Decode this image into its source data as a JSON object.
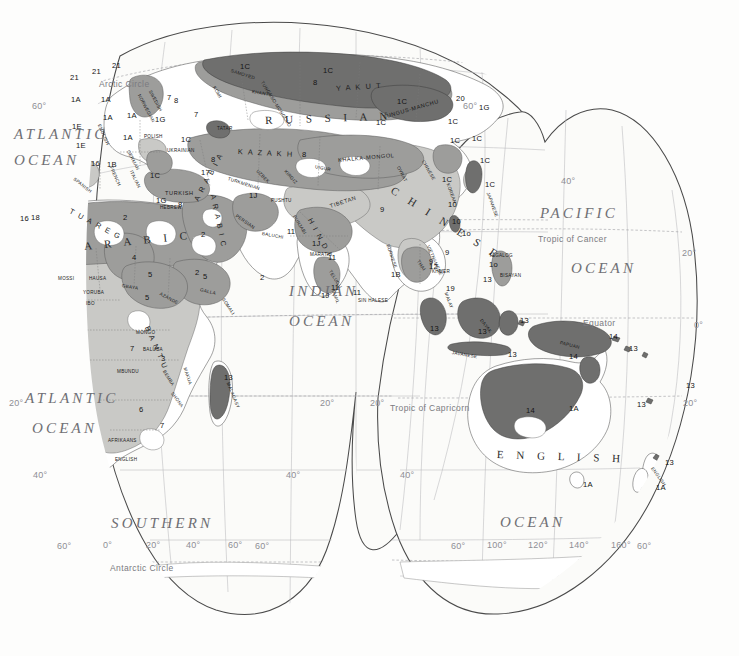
{
  "map": {
    "title": "World Language Families Map (Eastern Hemisphere)",
    "projection": "interrupted-homolosine",
    "palette": {
      "background": "#fdfdfc",
      "ocean": "#fbfbf9",
      "land_light": "#ffffff",
      "shade_light": "#c9c9c6",
      "shade_medium": "#9d9d9b",
      "shade_dark": "#6f6f6e",
      "shade_darkest": "#4b4b4a",
      "outline": "#4a4a4a",
      "border": "#6b6b6b",
      "graticule": "#9b9b9f",
      "label_ocean": "#6f6f74"
    },
    "oceans": [
      {
        "name": "ATLANTIC",
        "x": 14,
        "y": 126,
        "size": "major"
      },
      {
        "name": "OCEAN",
        "x": 14,
        "y": 152,
        "size": "major"
      },
      {
        "name": "ATLANTIC",
        "x": 25,
        "y": 390,
        "size": "major"
      },
      {
        "name": "OCEAN",
        "x": 32,
        "y": 420,
        "size": "major"
      },
      {
        "name": "INDIAN",
        "x": 289,
        "y": 283,
        "size": "major"
      },
      {
        "name": "OCEAN",
        "x": 289,
        "y": 313,
        "size": "major"
      },
      {
        "name": "PACIFIC",
        "x": 540,
        "y": 205,
        "size": "major"
      },
      {
        "name": "OCEAN",
        "x": 571,
        "y": 260,
        "size": "major"
      },
      {
        "name": "SOUTHERN",
        "x": 111,
        "y": 515,
        "size": "major"
      },
      {
        "name": "OCEAN",
        "x": 500,
        "y": 514,
        "size": "major"
      }
    ],
    "reference_lines": [
      {
        "label": "Arctic Circle",
        "x": 99,
        "y": 79
      },
      {
        "label": "Tropic of Cancer",
        "x": 538,
        "y": 234
      },
      {
        "label": "Equator",
        "x": 583,
        "y": 318
      },
      {
        "label": "Tropic of Capricorn",
        "x": 390,
        "y": 403
      },
      {
        "label": "Antarctic Circle",
        "x": 110,
        "y": 563
      }
    ],
    "graticule_labels": [
      {
        "label": "60°",
        "x": 32,
        "y": 101
      },
      {
        "label": "60°",
        "x": 463,
        "y": 101
      },
      {
        "label": "40°",
        "x": 561,
        "y": 176
      },
      {
        "label": "20°",
        "x": 682,
        "y": 248
      },
      {
        "label": "0°",
        "x": 694,
        "y": 320
      },
      {
        "label": "20°",
        "x": 9,
        "y": 398
      },
      {
        "label": "20°",
        "x": 320,
        "y": 398
      },
      {
        "label": "20°",
        "x": 370,
        "y": 398
      },
      {
        "label": "20°",
        "x": 683,
        "y": 398
      },
      {
        "label": "40°",
        "x": 33,
        "y": 470
      },
      {
        "label": "40°",
        "x": 286,
        "y": 470
      },
      {
        "label": "40°",
        "x": 400,
        "y": 470
      },
      {
        "label": "60°",
        "x": 57,
        "y": 541
      },
      {
        "label": "0°",
        "x": 103,
        "y": 540
      },
      {
        "label": "20°",
        "x": 146,
        "y": 540
      },
      {
        "label": "40°",
        "x": 186,
        "y": 540
      },
      {
        "label": "60°",
        "x": 228,
        "y": 540
      },
      {
        "label": "60°",
        "x": 255,
        "y": 541
      },
      {
        "label": "60°",
        "x": 451,
        "y": 541
      },
      {
        "label": "100°",
        "x": 487,
        "y": 540
      },
      {
        "label": "120°",
        "x": 528,
        "y": 540
      },
      {
        "label": "140°",
        "x": 569,
        "y": 540
      },
      {
        "label": "160°",
        "x": 611,
        "y": 540
      },
      {
        "label": "60°",
        "x": 637,
        "y": 541
      }
    ],
    "language_labels": [
      {
        "text": "R U S S I A N",
        "x": 265,
        "y": 114,
        "cls": "lang-big",
        "rot": -2
      },
      {
        "text": "C H I N E S E",
        "x": 392,
        "y": 183,
        "cls": "lang-big",
        "rot": 32
      },
      {
        "text": "A R A B I C",
        "x": 84,
        "y": 240,
        "cls": "lang-big",
        "rot": -6
      },
      {
        "text": "E N G L I S H",
        "x": 497,
        "y": 448,
        "cls": "lang-big",
        "rot": 2
      },
      {
        "text": "K A Z A K H",
        "x": 238,
        "y": 147,
        "cls": "lang-mid",
        "rot": 3
      },
      {
        "text": "Y A K U T",
        "x": 336,
        "y": 84,
        "cls": "lang-mid",
        "rot": -4
      },
      {
        "text": "A R A B I C",
        "x": 213,
        "y": 190,
        "cls": "lang-mid",
        "rot": 78
      },
      {
        "text": "T U A R E G",
        "x": 70,
        "y": 206,
        "cls": "lang-mid",
        "rot": 28
      },
      {
        "text": "B A N T U",
        "x": 147,
        "y": 322,
        "cls": "lang-mid",
        "rot": 66
      },
      {
        "text": "A R A B I A",
        "x": 196,
        "y": 196,
        "cls": "lang-mid",
        "rot": -62
      },
      {
        "text": "H I N D I",
        "x": 310,
        "y": 214,
        "cls": "lang-mid",
        "rot": 62
      },
      {
        "text": "TIBETAN",
        "x": 330,
        "y": 203,
        "cls": "lang-small",
        "rot": -18
      },
      {
        "text": "TUNGUS-MANCHU",
        "x": 383,
        "y": 114,
        "cls": "lang-small",
        "rot": -16
      },
      {
        "text": "TUNGUSO-MONGOLO",
        "x": 262,
        "y": 79,
        "cls": "lang-tiny",
        "rot": 58
      },
      {
        "text": "KHALKA-MONGOL",
        "x": 338,
        "y": 157,
        "cls": "lang-small",
        "rot": -5
      },
      {
        "text": "SAMOYED",
        "x": 231,
        "y": 68,
        "cls": "lang-tiny",
        "rot": 18
      },
      {
        "text": "KHANTY",
        "x": 252,
        "y": 89,
        "cls": "lang-tiny",
        "rot": 10
      },
      {
        "text": "KOMI",
        "x": 214,
        "y": 84,
        "cls": "lang-tiny",
        "rot": 60
      },
      {
        "text": "TATAR",
        "x": 217,
        "y": 126,
        "cls": "lang-tiny",
        "rot": 0
      },
      {
        "text": "UZBEK",
        "x": 257,
        "y": 168,
        "cls": "lang-tiny",
        "rot": 45
      },
      {
        "text": "KIRGIZ",
        "x": 285,
        "y": 168,
        "cls": "lang-tiny",
        "rot": 48
      },
      {
        "text": "UIGUR",
        "x": 315,
        "y": 164,
        "cls": "lang-tiny",
        "rot": 12
      },
      {
        "text": "TURKMENIAN",
        "x": 228,
        "y": 176,
        "cls": "lang-tiny",
        "rot": 18
      },
      {
        "text": "OYRAT",
        "x": 398,
        "y": 164,
        "cls": "lang-tiny",
        "rot": 62
      },
      {
        "text": "CHINESE",
        "x": 423,
        "y": 158,
        "cls": "lang-tiny",
        "rot": 60
      },
      {
        "text": "KOREAN",
        "x": 448,
        "y": 181,
        "cls": "lang-tiny",
        "rot": 70
      },
      {
        "text": "JAPANESE",
        "x": 488,
        "y": 190,
        "cls": "lang-tiny",
        "rot": 70
      },
      {
        "text": "TURKISH",
        "x": 165,
        "y": 190,
        "cls": "lang-small",
        "rot": 0
      },
      {
        "text": "HEBREW",
        "x": 160,
        "y": 205,
        "cls": "lang-tiny",
        "rot": 0
      },
      {
        "text": "PERSIAN",
        "x": 236,
        "y": 213,
        "cls": "lang-tiny",
        "rot": 34
      },
      {
        "text": "PUSHTU",
        "x": 271,
        "y": 198,
        "cls": "lang-tiny",
        "rot": 0
      },
      {
        "text": "PUNJABI",
        "x": 294,
        "y": 213,
        "cls": "lang-tiny",
        "rot": 58
      },
      {
        "text": "BALUCHI",
        "x": 262,
        "y": 231,
        "cls": "lang-tiny",
        "rot": 10
      },
      {
        "text": "MARATHI",
        "x": 310,
        "y": 252,
        "cls": "lang-tiny",
        "rot": 0
      },
      {
        "text": "TELUGU",
        "x": 330,
        "y": 268,
        "cls": "lang-tiny",
        "rot": 58
      },
      {
        "text": "TAMIL",
        "x": 333,
        "y": 287,
        "cls": "lang-tiny",
        "rot": 70
      },
      {
        "text": "SIN HALESE",
        "x": 358,
        "y": 298,
        "cls": "lang-tiny",
        "rot": 0
      },
      {
        "text": "BURMESE",
        "x": 388,
        "y": 242,
        "cls": "lang-tiny",
        "rot": 72
      },
      {
        "text": "THAI",
        "x": 418,
        "y": 258,
        "cls": "lang-tiny",
        "rot": 56
      },
      {
        "text": "KHMER",
        "x": 432,
        "y": 269,
        "cls": "lang-tiny",
        "rot": 0
      },
      {
        "text": "VIETNAMESE",
        "x": 428,
        "y": 243,
        "cls": "lang-tiny",
        "rot": 66
      },
      {
        "text": "MALAY",
        "x": 446,
        "y": 290,
        "cls": "lang-tiny",
        "rot": 70
      },
      {
        "text": "TAGALOG",
        "x": 489,
        "y": 253,
        "cls": "lang-tiny",
        "rot": 0
      },
      {
        "text": "BISAYAN",
        "x": 500,
        "y": 273,
        "cls": "lang-tiny",
        "rot": 0
      },
      {
        "text": "DAYAK",
        "x": 481,
        "y": 317,
        "cls": "lang-tiny",
        "rot": 52
      },
      {
        "text": "JAVANESE",
        "x": 452,
        "y": 350,
        "cls": "lang-tiny",
        "rot": 10
      },
      {
        "text": "PAPUAN",
        "x": 560,
        "y": 340,
        "cls": "lang-tiny",
        "rot": 14
      },
      {
        "text": "MALAGASY",
        "x": 228,
        "y": 380,
        "cls": "lang-tiny",
        "rot": 68
      },
      {
        "text": "POLISH",
        "x": 144,
        "y": 134,
        "cls": "lang-tiny",
        "rot": 0
      },
      {
        "text": "UKRAINIAN",
        "x": 167,
        "y": 148,
        "cls": "lang-tiny",
        "rot": 0
      },
      {
        "text": "FRENCH",
        "x": 111,
        "y": 164,
        "cls": "lang-tiny",
        "rot": 66
      },
      {
        "text": "SPANISH",
        "x": 74,
        "y": 176,
        "cls": "lang-tiny",
        "rot": 38
      },
      {
        "text": "NORWEGIAN",
        "x": 139,
        "y": 92,
        "cls": "lang-tiny",
        "rot": 62
      },
      {
        "text": "SWEDISH",
        "x": 150,
        "y": 88,
        "cls": "lang-tiny",
        "rot": 62
      },
      {
        "text": "ENGLISH",
        "x": 99,
        "y": 122,
        "cls": "lang-tiny",
        "rot": 66
      },
      {
        "text": "GERMAN",
        "x": 128,
        "y": 148,
        "cls": "lang-tiny",
        "rot": 62
      },
      {
        "text": "ITALIAN",
        "x": 131,
        "y": 168,
        "cls": "lang-tiny",
        "rot": 64
      },
      {
        "text": "MOSSI",
        "x": 58,
        "y": 276,
        "cls": "lang-tiny",
        "rot": 0
      },
      {
        "text": "HAUSA",
        "x": 89,
        "y": 276,
        "cls": "lang-tiny",
        "rot": 0
      },
      {
        "text": "YORUBA",
        "x": 83,
        "y": 290,
        "cls": "lang-tiny",
        "rot": 0
      },
      {
        "text": "IBO",
        "x": 86,
        "y": 301,
        "cls": "lang-tiny",
        "rot": 0
      },
      {
        "text": "GBAYA",
        "x": 122,
        "y": 283,
        "cls": "lang-tiny",
        "rot": 10
      },
      {
        "text": "AZANDE",
        "x": 160,
        "y": 291,
        "cls": "lang-tiny",
        "rot": 28
      },
      {
        "text": "GALLA",
        "x": 200,
        "y": 287,
        "cls": "lang-tiny",
        "rot": 14
      },
      {
        "text": "SOMALI",
        "x": 223,
        "y": 296,
        "cls": "lang-tiny",
        "rot": 56
      },
      {
        "text": "MONGO",
        "x": 136,
        "y": 330,
        "cls": "lang-tiny",
        "rot": 0
      },
      {
        "text": "BALUBA",
        "x": 143,
        "y": 347,
        "cls": "lang-tiny",
        "rot": 0
      },
      {
        "text": "MBUNDU",
        "x": 117,
        "y": 369,
        "cls": "lang-tiny",
        "rot": 0
      },
      {
        "text": "BEMBA",
        "x": 164,
        "y": 368,
        "cls": "lang-tiny",
        "rot": 58
      },
      {
        "text": "MAKUA",
        "x": 185,
        "y": 365,
        "cls": "lang-tiny",
        "rot": 72
      },
      {
        "text": "SHONA",
        "x": 172,
        "y": 390,
        "cls": "lang-tiny",
        "rot": 54
      },
      {
        "text": "AFRIKAANS",
        "x": 108,
        "y": 438,
        "cls": "lang-tiny",
        "rot": 0
      },
      {
        "text": "ENGLISH",
        "x": 115,
        "y": 457,
        "cls": "lang-tiny",
        "rot": 0
      },
      {
        "text": "ENGLISH",
        "x": 652,
        "y": 465,
        "cls": "lang-tiny",
        "rot": 54
      }
    ],
    "code_labels": [
      {
        "t": "21",
        "x": 70,
        "y": 73
      },
      {
        "t": "21",
        "x": 92,
        "y": 67
      },
      {
        "t": "21",
        "x": 112,
        "y": 61
      },
      {
        "t": "1A",
        "x": 71,
        "y": 95
      },
      {
        "t": "1A",
        "x": 101,
        "y": 95
      },
      {
        "t": "1A",
        "x": 127,
        "y": 111
      },
      {
        "t": "1A",
        "x": 123,
        "y": 133
      },
      {
        "t": "1E",
        "x": 72,
        "y": 122
      },
      {
        "t": "1E",
        "x": 76,
        "y": 141
      },
      {
        "t": "1A",
        "x": 103,
        "y": 113
      },
      {
        "t": "16",
        "x": 91,
        "y": 159
      },
      {
        "t": "1B",
        "x": 107,
        "y": 160
      },
      {
        "t": "1C",
        "x": 150,
        "y": 171
      },
      {
        "t": "1C",
        "x": 181,
        "y": 135
      },
      {
        "t": "1C",
        "x": 240,
        "y": 62
      },
      {
        "t": "1C",
        "x": 323,
        "y": 66
      },
      {
        "t": "1C",
        "x": 397,
        "y": 97
      },
      {
        "t": "1C",
        "x": 376,
        "y": 118
      },
      {
        "t": "1C",
        "x": 448,
        "y": 117
      },
      {
        "t": "1C",
        "x": 450,
        "y": 136
      },
      {
        "t": "1C",
        "x": 472,
        "y": 134
      },
      {
        "t": "1C",
        "x": 480,
        "y": 156
      },
      {
        "t": "1C",
        "x": 485,
        "y": 180
      },
      {
        "t": "1C",
        "x": 442,
        "y": 175
      },
      {
        "t": "1G",
        "x": 479,
        "y": 103
      },
      {
        "t": "1G",
        "x": 156,
        "y": 196
      },
      {
        "t": "1G",
        "x": 155,
        "y": 115
      },
      {
        "t": "1J",
        "x": 249,
        "y": 191
      },
      {
        "t": "1J",
        "x": 312,
        "y": 239
      },
      {
        "t": "1J",
        "x": 321,
        "y": 291
      },
      {
        "t": "1B",
        "x": 391,
        "y": 270
      },
      {
        "t": "1A",
        "x": 569,
        "y": 404
      },
      {
        "t": "1A",
        "x": 583,
        "y": 480
      },
      {
        "t": "1A",
        "x": 656,
        "y": 483
      },
      {
        "t": "2",
        "x": 123,
        "y": 213
      },
      {
        "t": "2",
        "x": 201,
        "y": 230
      },
      {
        "t": "2",
        "x": 260,
        "y": 273
      },
      {
        "t": "2",
        "x": 195,
        "y": 268
      },
      {
        "t": "3",
        "x": 161,
        "y": 354
      },
      {
        "t": "4",
        "x": 132,
        "y": 253
      },
      {
        "t": "5",
        "x": 148,
        "y": 270
      },
      {
        "t": "5",
        "x": 145,
        "y": 293
      },
      {
        "t": "5",
        "x": 203,
        "y": 272
      },
      {
        "t": "6",
        "x": 139,
        "y": 405
      },
      {
        "t": "7",
        "x": 130,
        "y": 344
      },
      {
        "t": "7",
        "x": 160,
        "y": 421
      },
      {
        "t": "7",
        "x": 167,
        "y": 93
      },
      {
        "t": "7",
        "x": 194,
        "y": 110
      },
      {
        "t": "8",
        "x": 174,
        "y": 96
      },
      {
        "t": "8",
        "x": 313,
        "y": 78
      },
      {
        "t": "8",
        "x": 302,
        "y": 150
      },
      {
        "t": "8",
        "x": 211,
        "y": 155
      },
      {
        "t": "8",
        "x": 178,
        "y": 200
      },
      {
        "t": "9",
        "x": 380,
        "y": 205
      },
      {
        "t": "9",
        "x": 445,
        "y": 248
      },
      {
        "t": "9",
        "x": 429,
        "y": 257
      },
      {
        "t": "10",
        "x": 448,
        "y": 200
      },
      {
        "t": "10",
        "x": 452,
        "y": 217
      },
      {
        "t": "1o",
        "x": 462,
        "y": 229
      },
      {
        "t": "1o",
        "x": 489,
        "y": 260
      },
      {
        "t": "11",
        "x": 287,
        "y": 227
      },
      {
        "t": "11",
        "x": 328,
        "y": 253
      },
      {
        "t": "11",
        "x": 331,
        "y": 283
      },
      {
        "t": "11",
        "x": 353,
        "y": 288
      },
      {
        "t": "12",
        "x": 429,
        "y": 262
      },
      {
        "t": "13",
        "x": 483,
        "y": 275
      },
      {
        "t": "13",
        "x": 520,
        "y": 316
      },
      {
        "t": "13",
        "x": 430,
        "y": 324
      },
      {
        "t": "13",
        "x": 478,
        "y": 327
      },
      {
        "t": "13",
        "x": 508,
        "y": 350
      },
      {
        "t": "13",
        "x": 629,
        "y": 344
      },
      {
        "t": "13",
        "x": 637,
        "y": 400
      },
      {
        "t": "13",
        "x": 686,
        "y": 381
      },
      {
        "t": "13",
        "x": 665,
        "y": 458
      },
      {
        "t": "13",
        "x": 224,
        "y": 373
      },
      {
        "t": "14",
        "x": 609,
        "y": 332
      },
      {
        "t": "14",
        "x": 569,
        "y": 352
      },
      {
        "t": "14",
        "x": 526,
        "y": 406
      },
      {
        "t": "16",
        "x": 20,
        "y": 214
      },
      {
        "t": "17",
        "x": 201,
        "y": 168
      },
      {
        "t": "18",
        "x": 31,
        "y": 213
      },
      {
        "t": "19",
        "x": 446,
        "y": 284
      },
      {
        "t": "20",
        "x": 456,
        "y": 94
      }
    ]
  }
}
